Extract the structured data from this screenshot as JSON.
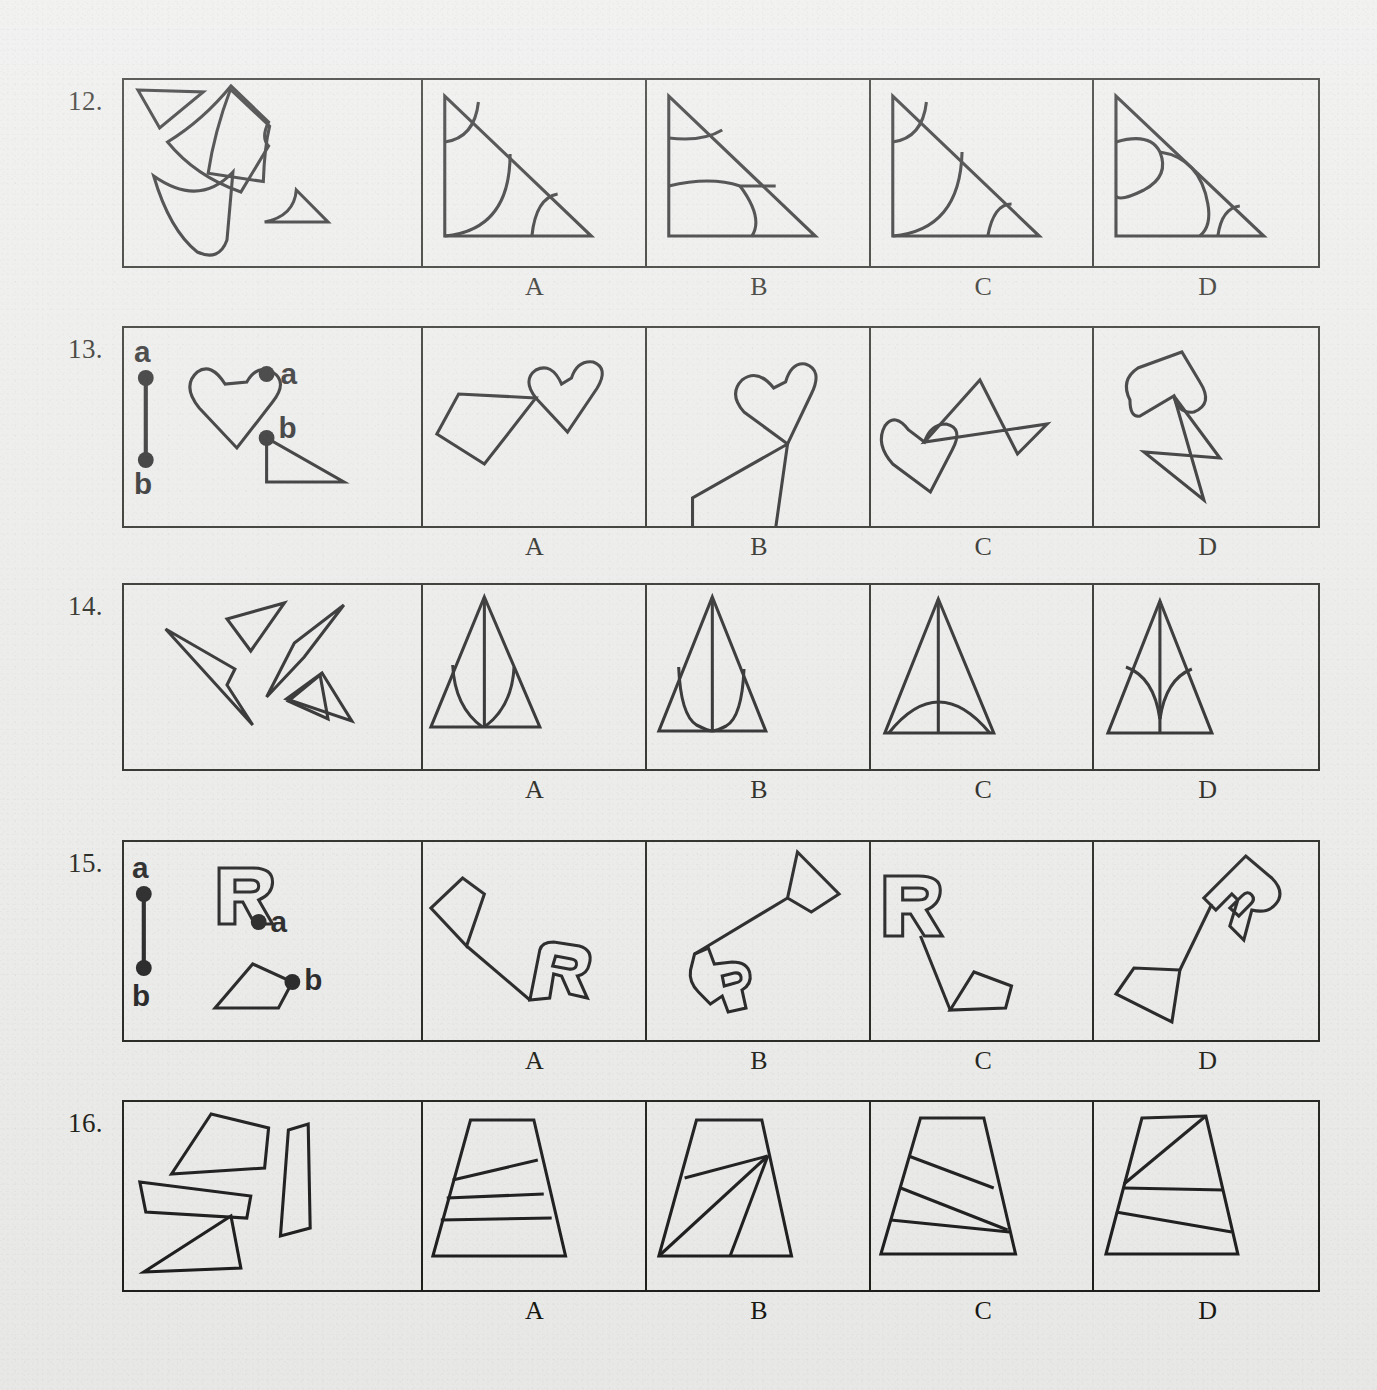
{
  "page": {
    "background_color": "#ececeb",
    "ink_color": "#19191a",
    "type": "spatial-reasoning-worksheet"
  },
  "option_labels": [
    "A",
    "B",
    "C",
    "D"
  ],
  "rows": [
    {
      "number": "12.",
      "prompt_kind": "loose-pieces",
      "prompt_description": "four curved/straight fragments: small triangle, large curved quadrilateral, crescent shape, small curved triangle",
      "options": [
        {
          "label": "A",
          "description": "right triangle with two quarter-arcs and one corner arc"
        },
        {
          "label": "B",
          "description": "right triangle with a small arc near the apex and a large rounded blob at the base"
        },
        {
          "label": "C",
          "description": "right triangle with small apex arc, large quarter circle and small base arc"
        },
        {
          "label": "D",
          "description": "right triangle with two S-curves and a corner arc at the right"
        }
      ]
    },
    {
      "number": "13.",
      "prompt_kind": "labeled-join",
      "prompt_description": "vertical segment with endpoints a and b; a heart marked a; a right triangle marked b",
      "point_labels": [
        "a",
        "b"
      ],
      "options": [
        {
          "label": "A",
          "description": "heart at upper right joined by a line to a thin triangle pointing down-right"
        },
        {
          "label": "B",
          "description": "heart at top joined by a long line to a right triangle at lower left"
        },
        {
          "label": "C",
          "description": "heart at left touching a tall narrow triangle/kite at right"
        },
        {
          "label": "D",
          "description": "heart at upper left joined by a line to a thin sliver triangle at lower right"
        }
      ]
    },
    {
      "number": "14.",
      "prompt_kind": "loose-pieces",
      "prompt_description": "four slender spike/sliver shapes scattered at various angles",
      "options": [
        {
          "label": "A",
          "description": "narrow tall triangle with central vertical line and two inner curved slivers"
        },
        {
          "label": "B",
          "description": "narrow tall triangle with central line and two deep U-shaped curves"
        },
        {
          "label": "C",
          "description": "narrow tall triangle with central vertical line and a single wide dome arc"
        },
        {
          "label": "D",
          "description": "narrow tall triangle with central line and two concave curves meeting low center"
        }
      ]
    },
    {
      "number": "15.",
      "prompt_kind": "labeled-join",
      "prompt_description": "vertical segment with endpoints a and b; an outlined letter R marked a; a pentagon marked b",
      "point_labels": [
        "a",
        "b"
      ],
      "point_shape_label": "R",
      "options": [
        {
          "label": "A",
          "description": "kite at upper left joined by a line down-right to an upright outlined R"
        },
        {
          "label": "B",
          "description": "quadrilateral at upper right joined by a line down-left to an upside-down R"
        },
        {
          "label": "C",
          "description": "upright outlined R at upper left joined by a line down to a pentagon"
        },
        {
          "label": "D",
          "description": "pentagon at lower left joined by a line up-right to a rotated outlined R"
        }
      ]
    },
    {
      "number": "16.",
      "prompt_kind": "loose-pieces",
      "prompt_description": "four flat quadrilateral strips: wedge, tall narrow slab, thin parallelogram strip, thin triangle strip",
      "options": [
        {
          "label": "A",
          "description": "trapezoid divided by one slanted line and two near-horizontal lines"
        },
        {
          "label": "B",
          "description": "trapezoid with three lines radiating from a point on the right edge"
        },
        {
          "label": "C",
          "description": "trapezoid divided by three slanted lines converging at lower right"
        },
        {
          "label": "D",
          "description": "trapezoid with a diagonal to the top-right corner and two slanted lines"
        }
      ]
    }
  ]
}
